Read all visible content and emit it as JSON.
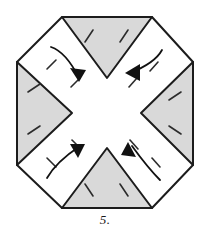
{
  "figure": {
    "caption": "5.",
    "colors": {
      "outline": "#1c1c1c",
      "shaded_fill": "#d9d9d9",
      "paper_fill": "#ffffff",
      "fold_line": "#2b2b2b",
      "arrow": "#111111",
      "background": "#ffffff"
    },
    "octagon": {
      "label": "octagon-outline",
      "stroke_width": 2,
      "vertices": [
        [
          62,
          17
        ],
        [
          152,
          17
        ],
        [
          193,
          62
        ],
        [
          193,
          165
        ],
        [
          152,
          208
        ],
        [
          62,
          208
        ],
        [
          17,
          165
        ],
        [
          17,
          62
        ]
      ]
    },
    "shaded_flaps": [
      {
        "name": "top-flap",
        "direction": "down",
        "points": [
          [
            62,
            17
          ],
          [
            152,
            17
          ],
          [
            107,
            78
          ]
        ],
        "fold_dashes": [
          [
            [
              93,
              30
            ],
            [
              85,
              42
            ]
          ],
          [
            [
              128,
              30
            ],
            [
              120,
              42
            ]
          ]
        ]
      },
      {
        "name": "left-flap",
        "direction": "right",
        "points": [
          [
            17,
            62
          ],
          [
            17,
            165
          ],
          [
            72,
            113
          ]
        ],
        "fold_dashes": [
          [
            [
              28,
              92
            ],
            [
              40,
              84
            ]
          ],
          [
            [
              28,
              134
            ],
            [
              40,
              126
            ]
          ]
        ]
      },
      {
        "name": "right-flap",
        "direction": "left",
        "points": [
          [
            193,
            62
          ],
          [
            193,
            165
          ],
          [
            141,
            113
          ]
        ],
        "fold_dashes": [
          [
            [
              181,
              92
            ],
            [
              169,
              100
            ]
          ],
          [
            [
              181,
              134
            ],
            [
              169,
              126
            ]
          ]
        ]
      },
      {
        "name": "bottom-flap",
        "direction": "up",
        "points": [
          [
            62,
            208
          ],
          [
            152,
            208
          ],
          [
            107,
            148
          ]
        ],
        "fold_dashes": [
          [
            [
              93,
              196
            ],
            [
              85,
              184
            ]
          ],
          [
            [
              128,
              196
            ],
            [
              120,
              184
            ]
          ]
        ]
      }
    ],
    "white_panels": [
      {
        "name": "top-left-panel",
        "points": [
          [
            62,
            17
          ],
          [
            107,
            78
          ],
          [
            72,
            113
          ],
          [
            17,
            62
          ]
        ],
        "fold_dashes": [
          [
            [
              56,
              60
            ],
            [
              47,
              69
            ]
          ],
          [
            [
              80,
              78
            ],
            [
              71,
              87
            ]
          ]
        ]
      },
      {
        "name": "top-right-panel",
        "points": [
          [
            152,
            17
          ],
          [
            193,
            62
          ],
          [
            141,
            113
          ],
          [
            107,
            78
          ]
        ],
        "fold_dashes": [
          [
            [
              158,
              62
            ],
            [
              150,
              71
            ]
          ],
          [
            [
              137,
              78
            ],
            [
              129,
              87
            ]
          ]
        ]
      },
      {
        "name": "bottom-left-panel",
        "points": [
          [
            17,
            165
          ],
          [
            72,
            113
          ],
          [
            107,
            148
          ],
          [
            62,
            208
          ]
        ],
        "fold_dashes": [
          [
            [
              47,
              158
            ],
            [
              56,
              167
            ]
          ],
          [
            [
              72,
              140
            ],
            [
              81,
              149
            ]
          ]
        ]
      },
      {
        "name": "bottom-right-panel",
        "points": [
          [
            193,
            165
          ],
          [
            152,
            208
          ],
          [
            107,
            148
          ],
          [
            141,
            113
          ]
        ],
        "fold_dashes": [
          [
            [
              152,
              158
            ],
            [
              160,
              167
            ]
          ],
          [
            [
              130,
              140
            ],
            [
              138,
              149
            ]
          ]
        ]
      }
    ],
    "arrows": [
      {
        "name": "arrow-top-left",
        "label": "fold-inward-top-left",
        "direction": "down-right",
        "path": "M 51,47 Q 66,52 79,78",
        "head": [
          [
            79,
            82
          ],
          [
            70,
            68
          ],
          [
            86,
            70
          ]
        ]
      },
      {
        "name": "arrow-top-right",
        "label": "fold-inward-top-right",
        "direction": "down-left",
        "path": "M 162,50 Q 155,63 130,73",
        "head": [
          [
            125,
            73
          ],
          [
            140,
            64
          ],
          [
            140,
            81
          ]
        ]
      },
      {
        "name": "arrow-bottom-left",
        "label": "fold-inward-bottom-left",
        "direction": "up-right",
        "path": "M 47,178 Q 56,162 80,146",
        "head": [
          [
            85,
            144
          ],
          [
            70,
            144
          ],
          [
            78,
            158
          ]
        ]
      },
      {
        "name": "arrow-bottom-right",
        "label": "fold-inward-bottom-right",
        "direction": "up-left",
        "path": "M 160,180 Q 148,168 132,146",
        "head": [
          [
            128,
            142
          ],
          [
            136,
            157
          ],
          [
            121,
            155
          ]
        ]
      }
    ]
  }
}
